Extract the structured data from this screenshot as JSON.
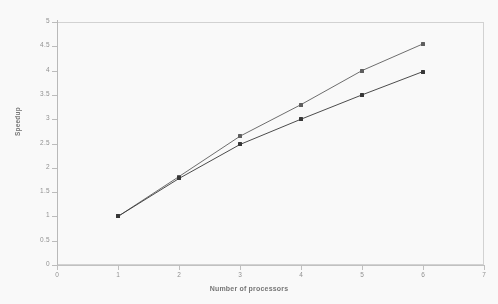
{
  "chart_data": {
    "type": "line",
    "title": "",
    "xlabel": "Number of processors",
    "ylabel": "Speedup",
    "x": [
      1,
      2,
      3,
      4,
      5,
      6
    ],
    "xlim": [
      0,
      7
    ],
    "ylim": [
      0,
      5
    ],
    "xticks": [
      "0",
      "1",
      "2",
      "3",
      "4",
      "5",
      "6",
      "7"
    ],
    "yticks": [
      "0",
      "0.5",
      "1",
      "1.5",
      "2",
      "2.5",
      "3",
      "3.5",
      "4",
      "4.5",
      "5"
    ],
    "grid": false,
    "legend": "none",
    "series": [
      {
        "name": "upper-curve",
        "marker": "square-open",
        "color": "#555555",
        "values": [
          1.0,
          1.82,
          2.65,
          3.3,
          4.0,
          4.55
        ]
      },
      {
        "name": "lower-curve",
        "marker": "square-filled",
        "color": "#2b2b2b",
        "values": [
          1.0,
          1.78,
          2.48,
          3.0,
          3.5,
          3.98
        ]
      }
    ]
  },
  "axes": {
    "x_title": "Number of processors",
    "y_title": "Speedup",
    "x_tick_labels": [
      "0",
      "1",
      "2",
      "3",
      "4",
      "5",
      "6",
      "7"
    ],
    "y_tick_labels": [
      "0",
      "0.5",
      "1",
      "1.5",
      "2",
      "2.5",
      "3",
      "3.5",
      "4",
      "4.5",
      "5"
    ]
  },
  "style": {
    "background": "#ffffff",
    "frame_color": "#d4d4d4",
    "tick_label_color": "#8d8d8d",
    "axis_title_color": "#6f6f6f",
    "series_upper_color": "#555555",
    "series_lower_color": "#2b2b2b"
  }
}
